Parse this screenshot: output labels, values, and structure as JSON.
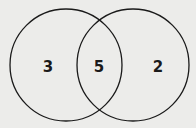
{
  "diagram": {
    "type": "venn",
    "colors": {
      "background": "#ececea",
      "stroke": "#1a1a1a"
    },
    "circles": [
      {
        "id": "left",
        "cx": 66,
        "cy": 65,
        "r": 56
      },
      {
        "id": "right",
        "cx": 133,
        "cy": 65,
        "r": 56
      }
    ],
    "regions": {
      "left_only": "3",
      "intersection": "5",
      "right_only": "2"
    }
  }
}
